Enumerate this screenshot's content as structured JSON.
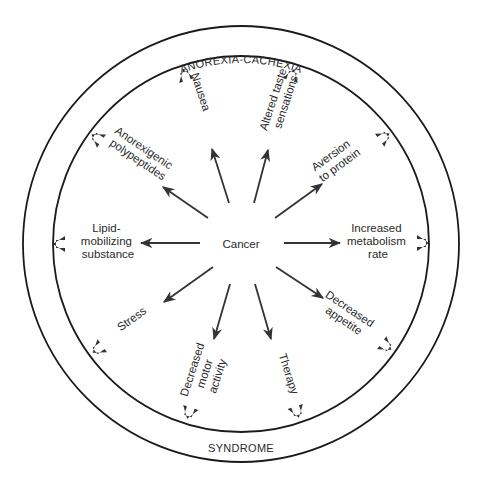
{
  "diagram": {
    "title_top": "ANOREXIA-CACHEXIA",
    "title_bottom": "SYNDROME",
    "center_label": "Cancer",
    "colors": {
      "ink": "#333333",
      "ring": "#1a1a1a",
      "background": "#ffffff"
    },
    "factors": [
      {
        "id": "nausea",
        "lines": [
          "Nausea"
        ]
      },
      {
        "id": "altered-taste",
        "lines": [
          "Altered taste",
          "sensations"
        ]
      },
      {
        "id": "anorexigenic",
        "lines": [
          "Anorexigenic",
          "polypeptides"
        ]
      },
      {
        "id": "aversion",
        "lines": [
          "Aversion",
          "to protein"
        ]
      },
      {
        "id": "lipid",
        "lines": [
          "Lipid-",
          "mobilizing",
          "substance"
        ]
      },
      {
        "id": "metabolism",
        "lines": [
          "Increased",
          "metabolism",
          "rate"
        ]
      },
      {
        "id": "stress",
        "lines": [
          "Stress"
        ]
      },
      {
        "id": "appetite",
        "lines": [
          "Decreased",
          "appetite"
        ]
      },
      {
        "id": "motor",
        "lines": [
          "Decreased",
          "motor",
          "activity"
        ]
      },
      {
        "id": "therapy",
        "lines": [
          "Therapy"
        ]
      }
    ]
  }
}
